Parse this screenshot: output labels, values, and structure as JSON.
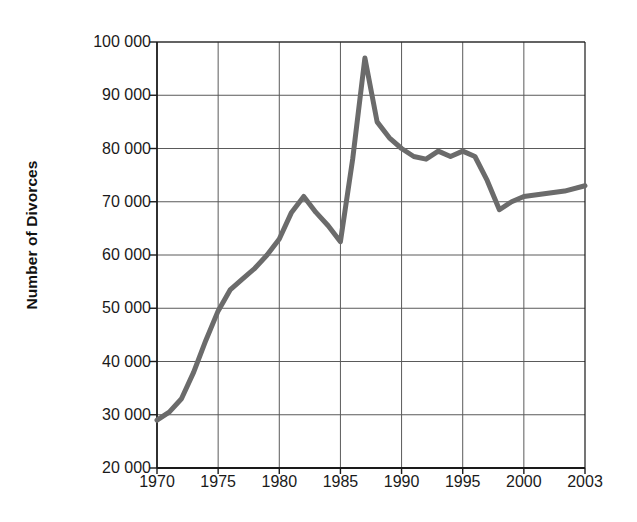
{
  "chart_data": {
    "type": "line",
    "title": "",
    "xlabel": "",
    "ylabel": "Number of Divorces",
    "xlim": [
      1970,
      2003
    ],
    "ylim": [
      20000,
      100000
    ],
    "grid": true,
    "legend": "none",
    "line_color": "#6b6b6b",
    "axis_color": "#1a1a1a",
    "grid_color": "#5a5a5a",
    "x_ticks": [
      "1970",
      "1975",
      "1980",
      "1985",
      "1990",
      "1995",
      "2000",
      "2003"
    ],
    "x_tick_values": [
      1970,
      1975,
      1980,
      1985,
      1990,
      1995,
      2000,
      2003
    ],
    "y_ticks": [
      "20 000",
      "30 000",
      "40 000",
      "50 000",
      "60 000",
      "70 000",
      "80 000",
      "90 000",
      "100 000"
    ],
    "y_tick_values": [
      20000,
      30000,
      40000,
      50000,
      60000,
      70000,
      80000,
      90000,
      100000
    ],
    "x": [
      1970,
      1971,
      1972,
      1973,
      1974,
      1975,
      1976,
      1977,
      1978,
      1979,
      1980,
      1981,
      1982,
      1983,
      1984,
      1985,
      1986,
      1987,
      1988,
      1989,
      1990,
      1991,
      1992,
      1993,
      1994,
      1995,
      1996,
      1997,
      1998,
      1999,
      2000,
      2001,
      2002,
      2003
    ],
    "values": [
      29000,
      30500,
      33000,
      38000,
      44000,
      49500,
      53500,
      55500,
      57500,
      60000,
      63000,
      68000,
      71000,
      68000,
      65500,
      62500,
      78000,
      97000,
      85000,
      82000,
      80000,
      78500,
      78000,
      79500,
      78500,
      79500,
      78500,
      74000,
      68500,
      70000,
      71000,
      71500,
      72000,
      73000
    ],
    "annotations": []
  },
  "plot_geometry": {
    "left": 157,
    "right": 585,
    "top": 42,
    "bottom": 468
  }
}
